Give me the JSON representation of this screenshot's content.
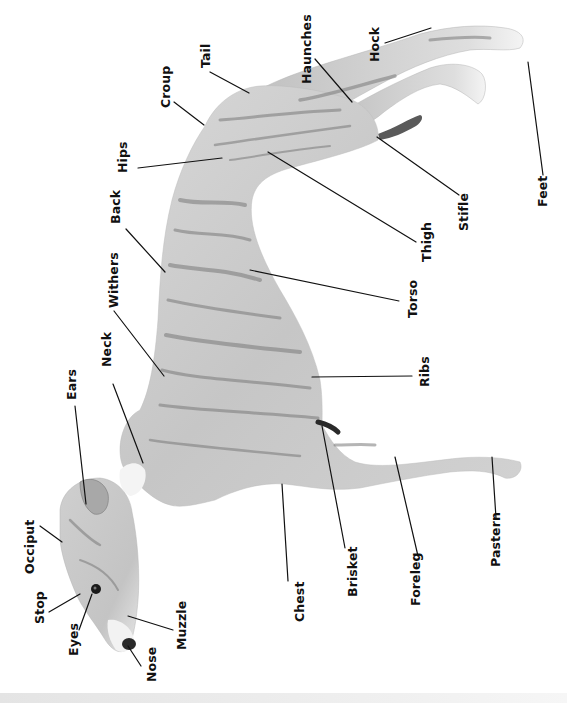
{
  "diagram": {
    "orientation": "rotated-90",
    "colors": {
      "background": "#ffffff",
      "body_fill": "#cfcfcf",
      "body_dark": "#8a8a8a",
      "stripe": "#6e6e6e",
      "leader_line": "#111111",
      "label_text": "#111111",
      "bottom_bar": "#e8e8e8"
    },
    "labels": [
      {
        "id": "occiput",
        "text": "Occiput",
        "x": 24,
        "y": 574
      },
      {
        "id": "stop",
        "text": "Stop",
        "x": 34,
        "y": 624
      },
      {
        "id": "eyes",
        "text": "Eyes",
        "x": 68,
        "y": 656
      },
      {
        "id": "nose",
        "text": "Nose",
        "x": 146,
        "y": 682
      },
      {
        "id": "muzzle",
        "text": "Muzzle",
        "x": 176,
        "y": 650
      },
      {
        "id": "ears",
        "text": "Ears",
        "x": 66,
        "y": 400
      },
      {
        "id": "neck",
        "text": "Neck",
        "x": 101,
        "y": 367
      },
      {
        "id": "withers",
        "text": "Withers",
        "x": 108,
        "y": 308
      },
      {
        "id": "back",
        "text": "Back",
        "x": 110,
        "y": 224
      },
      {
        "id": "hips",
        "text": "Hips",
        "x": 117,
        "y": 173
      },
      {
        "id": "croup",
        "text": "Croup",
        "x": 160,
        "y": 108
      },
      {
        "id": "tail",
        "text": "Tail",
        "x": 200,
        "y": 68
      },
      {
        "id": "haunches",
        "text": "Haunches",
        "x": 301,
        "y": 84
      },
      {
        "id": "hock",
        "text": "Hock",
        "x": 369,
        "y": 62
      },
      {
        "id": "feet",
        "text": "Feet",
        "x": 537,
        "y": 207
      },
      {
        "id": "stifle",
        "text": "Stifle",
        "x": 458,
        "y": 231
      },
      {
        "id": "thigh",
        "text": "Thigh",
        "x": 421,
        "y": 262
      },
      {
        "id": "torso",
        "text": "Torso",
        "x": 407,
        "y": 318
      },
      {
        "id": "ribs",
        "text": "Ribs",
        "x": 419,
        "y": 387
      },
      {
        "id": "chest",
        "text": "Chest",
        "x": 294,
        "y": 622
      },
      {
        "id": "brisket",
        "text": "Brisket",
        "x": 347,
        "y": 597
      },
      {
        "id": "foreleg",
        "text": "Foreleg",
        "x": 410,
        "y": 606
      },
      {
        "id": "pastern",
        "text": "Pastern",
        "x": 490,
        "y": 567
      }
    ],
    "leaders": [
      {
        "id": "occiput",
        "x1": 40,
        "y1": 526,
        "x2": 62,
        "y2": 542
      },
      {
        "id": "stop",
        "x1": 49,
        "y1": 612,
        "x2": 80,
        "y2": 594
      },
      {
        "id": "eyes",
        "x1": 79,
        "y1": 630,
        "x2": 92,
        "y2": 594
      },
      {
        "id": "nose",
        "x1": 141,
        "y1": 666,
        "x2": 128,
        "y2": 646
      },
      {
        "id": "muzzle",
        "x1": 173,
        "y1": 630,
        "x2": 128,
        "y2": 616
      },
      {
        "id": "ears",
        "x1": 75,
        "y1": 406,
        "x2": 86,
        "y2": 504
      },
      {
        "id": "neck",
        "x1": 113,
        "y1": 384,
        "x2": 143,
        "y2": 463
      },
      {
        "id": "withers",
        "x1": 114,
        "y1": 311,
        "x2": 164,
        "y2": 376
      },
      {
        "id": "back",
        "x1": 126,
        "y1": 229,
        "x2": 165,
        "y2": 272
      },
      {
        "id": "hips",
        "x1": 138,
        "y1": 168,
        "x2": 222,
        "y2": 158
      },
      {
        "id": "croup",
        "x1": 174,
        "y1": 102,
        "x2": 204,
        "y2": 125
      },
      {
        "id": "tail",
        "x1": 210,
        "y1": 72,
        "x2": 249,
        "y2": 93
      },
      {
        "id": "haunches",
        "x1": 315,
        "y1": 59,
        "x2": 352,
        "y2": 102
      },
      {
        "id": "hock",
        "x1": 385,
        "y1": 43,
        "x2": 431,
        "y2": 28
      },
      {
        "id": "feet",
        "x1": 543,
        "y1": 175,
        "x2": 528,
        "y2": 62
      },
      {
        "id": "stifle",
        "x1": 459,
        "y1": 195,
        "x2": 377,
        "y2": 137
      },
      {
        "id": "thigh",
        "x1": 416,
        "y1": 242,
        "x2": 268,
        "y2": 152
      },
      {
        "id": "torso",
        "x1": 399,
        "y1": 301,
        "x2": 250,
        "y2": 270
      },
      {
        "id": "ribs",
        "x1": 412,
        "y1": 376,
        "x2": 312,
        "y2": 377
      },
      {
        "id": "chest",
        "x1": 288,
        "y1": 581,
        "x2": 282,
        "y2": 484
      },
      {
        "id": "brisket",
        "x1": 345,
        "y1": 548,
        "x2": 322,
        "y2": 426
      },
      {
        "id": "foreleg",
        "x1": 418,
        "y1": 556,
        "x2": 395,
        "y2": 457
      },
      {
        "id": "pastern",
        "x1": 496,
        "y1": 518,
        "x2": 492,
        "y2": 457
      }
    ]
  }
}
